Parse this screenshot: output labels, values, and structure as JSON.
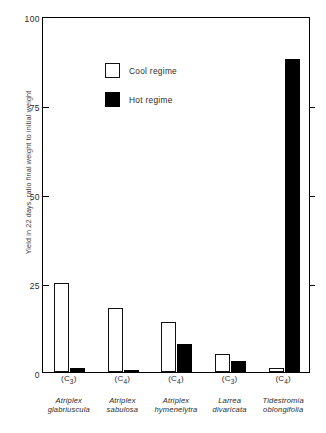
{
  "chart_data": {
    "type": "bar",
    "title": "",
    "xlabel": "",
    "ylabel": "Yield in 22 days, ratio final weight to initial weight",
    "ylim": [
      0,
      100
    ],
    "yticks": [
      0,
      25,
      50,
      75,
      100
    ],
    "ytick_labels": [
      "0",
      "25",
      "50",
      "75",
      "100"
    ],
    "grid": false,
    "legend_position": "upper-left-inside",
    "categories": [
      "Atriplex glabriuscula",
      "Atriplex sabulosa",
      "Atriplex hymenelytra",
      "Larrea divaricata",
      "Tidestromia oblongifolia"
    ],
    "category_pathways": [
      "C3",
      "C4",
      "C4",
      "C3",
      "C4"
    ],
    "series": [
      {
        "name": "Cool regime",
        "color": "#ffffff",
        "values": [
          25,
          18,
          14,
          5,
          1
        ]
      },
      {
        "name": "Hot regime",
        "color": "#000000",
        "values": [
          1,
          0.5,
          8,
          3,
          88
        ]
      }
    ]
  },
  "axes": {
    "ylabel": "Yield in 22 days, ratio final weight to initial weight",
    "yticks": [
      {
        "label": "100",
        "value": 100
      },
      {
        "label": "75",
        "value": 75
      },
      {
        "label": "50",
        "value": 50
      },
      {
        "label": "25",
        "value": 25
      },
      {
        "label": "0",
        "value": 0
      }
    ]
  },
  "legend": {
    "items": [
      {
        "label": "Cool regime",
        "swatch": "cool"
      },
      {
        "label": "Hot regime",
        "swatch": "hot"
      }
    ]
  },
  "xlabels": [
    {
      "pathway_prefix": "(C",
      "pathway_sub": "3",
      "pathway_suffix": ")",
      "line1": "Atriplex",
      "line2": "glabriuscula"
    },
    {
      "pathway_prefix": "(C",
      "pathway_sub": "4",
      "pathway_suffix": ")",
      "line1": "Atriplex",
      "line2": "sabulosa"
    },
    {
      "pathway_prefix": "(C",
      "pathway_sub": "4",
      "pathway_suffix": ")",
      "line1": "Atriplex",
      "line2": "hymenelytra"
    },
    {
      "pathway_prefix": "(C",
      "pathway_sub": "3",
      "pathway_suffix": ")",
      "line1": "Larrea",
      "line2": "divaricata"
    },
    {
      "pathway_prefix": "(C",
      "pathway_sub": "4",
      "pathway_suffix": ")",
      "line1": "Tidestromia",
      "line2": "oblongifolia"
    }
  ]
}
